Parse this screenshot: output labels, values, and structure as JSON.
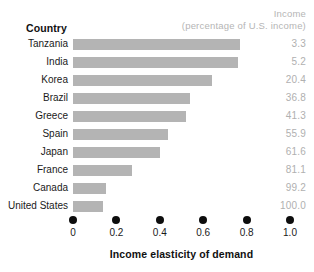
{
  "header": {
    "country_label": "Country",
    "income_line1": "Income",
    "income_line2": "(percentage of U.S. income)"
  },
  "axis": {
    "title": "Income elasticity of demand",
    "ticks": [
      "0",
      "0.2",
      "0.4",
      "0.6",
      "0.8",
      "1.0"
    ]
  },
  "colors": {
    "bar": "#b4b4b4",
    "value_text": "#b0b0b0",
    "header_text": "#b5b5b5",
    "label_text": "#1a1a1a",
    "tick_dot": "#0d0d0d",
    "background": "#ffffff"
  },
  "rows": [
    {
      "country": "Tanzania",
      "elasticity": 0.77,
      "income": "3.3"
    },
    {
      "country": "India",
      "elasticity": 0.76,
      "income": "5.2"
    },
    {
      "country": "Korea",
      "elasticity": 0.64,
      "income": "20.4"
    },
    {
      "country": "Brazil",
      "elasticity": 0.54,
      "income": "36.8"
    },
    {
      "country": "Greece",
      "elasticity": 0.52,
      "income": "41.3"
    },
    {
      "country": "Spain",
      "elasticity": 0.44,
      "income": "55.9"
    },
    {
      "country": "Japan",
      "elasticity": 0.4,
      "income": "61.6"
    },
    {
      "country": "France",
      "elasticity": 0.27,
      "income": "81.1"
    },
    {
      "country": "Canada",
      "elasticity": 0.15,
      "income": "99.2"
    },
    {
      "country": "United States",
      "elasticity": 0.14,
      "income": "100.0"
    }
  ],
  "chart_data": {
    "type": "bar",
    "title": "",
    "xlabel": "Income elasticity of demand",
    "ylabel": "Country",
    "orientation": "horizontal",
    "xlim": [
      0,
      1.0
    ],
    "xticks": [
      0,
      0.2,
      0.4,
      0.6,
      0.8,
      1.0
    ],
    "grid": false,
    "legend": false,
    "categories": [
      "Tanzania",
      "India",
      "Korea",
      "Brazil",
      "Greece",
      "Spain",
      "Japan",
      "France",
      "Canada",
      "United States"
    ],
    "values": [
      0.77,
      0.76,
      0.64,
      0.54,
      0.52,
      0.44,
      0.4,
      0.27,
      0.15,
      0.14
    ],
    "annotations": {
      "column_header": "Income (percentage of U.S. income)",
      "income_percent_of_us": [
        3.3,
        5.2,
        20.4,
        36.8,
        41.3,
        55.9,
        61.6,
        81.1,
        99.2,
        100.0
      ]
    }
  }
}
